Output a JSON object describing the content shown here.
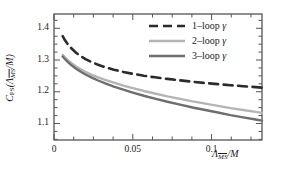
{
  "chart_data": {
    "type": "line",
    "title": "",
    "xlabel": "Λ_MSbar/M",
    "xlabel_parts": {
      "lambda": "Λ",
      "msbar": "MS",
      "slash_m": "/M"
    },
    "ylabel": "C_PS(Λ_MSbar/M)",
    "ylabel_parts": {
      "c": "C",
      "ps": "PS",
      "open": "(",
      "lambda": "Λ",
      "msbar": "MS",
      "slash_m": "/M",
      "close": ")"
    },
    "xlim": [
      0,
      0.132
    ],
    "ylim": [
      1.048,
      1.445
    ],
    "xticks": [
      0,
      0.05,
      0.1
    ],
    "xtick_labels": [
      "0",
      "0.05",
      "0.1"
    ],
    "xminor_step": 0.0125,
    "yticks": [
      1.1,
      1.2,
      1.3,
      1.4
    ],
    "ytick_labels": [
      "1.1",
      "1.2",
      "1.3",
      "1.4"
    ],
    "yminor_step": 0.025,
    "grid": false,
    "legend_position": "top-right",
    "series": [
      {
        "name": "1–loop γ",
        "label_parts": {
          "order": "1–loop",
          "gamma": "γ"
        },
        "color": "#2b2b2b",
        "style": "dashed",
        "width": 2.6,
        "x": [
          0.0055,
          0.007,
          0.009,
          0.011,
          0.014,
          0.017,
          0.02,
          0.024,
          0.028,
          0.033,
          0.038,
          0.044,
          0.05,
          0.057,
          0.064,
          0.072,
          0.08,
          0.088,
          0.096,
          0.104,
          0.112,
          0.12,
          0.128,
          0.132
        ],
        "y": [
          1.375,
          1.362,
          1.348,
          1.337,
          1.323,
          1.312,
          1.303,
          1.293,
          1.285,
          1.2765,
          1.2695,
          1.2625,
          1.2565,
          1.2505,
          1.2455,
          1.2405,
          1.236,
          1.2315,
          1.2275,
          1.224,
          1.2205,
          1.2175,
          1.2145,
          1.213
        ]
      },
      {
        "name": "2–loop γ",
        "label_parts": {
          "order": "2–loop",
          "gamma": "γ"
        },
        "color": "#b4b4b4",
        "style": "solid",
        "width": 2.4,
        "x": [
          0.0055,
          0.007,
          0.009,
          0.011,
          0.014,
          0.017,
          0.02,
          0.024,
          0.028,
          0.033,
          0.038,
          0.044,
          0.05,
          0.057,
          0.064,
          0.072,
          0.08,
          0.088,
          0.096,
          0.104,
          0.112,
          0.12,
          0.128,
          0.132
        ],
        "y": [
          1.316,
          1.308,
          1.2985,
          1.2905,
          1.2795,
          1.2705,
          1.2625,
          1.2535,
          1.2455,
          1.2365,
          1.2285,
          1.2195,
          1.2115,
          1.2025,
          1.1945,
          1.1855,
          1.1775,
          1.1695,
          1.1625,
          1.1555,
          1.1485,
          1.1425,
          1.1365,
          1.1335
        ]
      },
      {
        "name": "3–loop γ",
        "label_parts": {
          "order": "3–loop",
          "gamma": "γ"
        },
        "color": "#6e6e6e",
        "style": "solid",
        "width": 2.4,
        "x": [
          0.0055,
          0.007,
          0.009,
          0.011,
          0.014,
          0.017,
          0.02,
          0.024,
          0.028,
          0.033,
          0.038,
          0.044,
          0.05,
          0.057,
          0.064,
          0.072,
          0.08,
          0.088,
          0.096,
          0.104,
          0.112,
          0.12,
          0.128,
          0.132
        ],
        "y": [
          1.311,
          1.3025,
          1.2925,
          1.284,
          1.2725,
          1.263,
          1.2545,
          1.2445,
          1.2355,
          1.2255,
          1.2165,
          1.2065,
          1.1975,
          1.1875,
          1.1785,
          1.1685,
          1.1595,
          1.1505,
          1.1425,
          1.1345,
          1.1265,
          1.1195,
          1.1125,
          1.109
        ]
      }
    ]
  },
  "axes": {
    "frame_color": "#555555",
    "background": "#ffffff"
  }
}
